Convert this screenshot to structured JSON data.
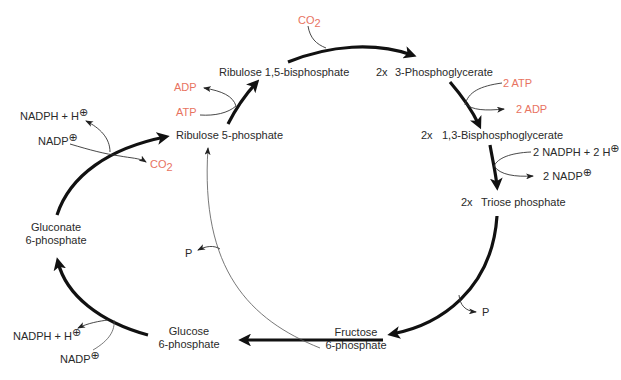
{
  "colors": {
    "text": "#2a2a2a",
    "cofactor_red": "#e8735f",
    "arrow": "#111111"
  },
  "metabolites": {
    "ribulose_15_bisphosphate": "Ribulose 1,5-bisphosphate",
    "phosphoglycerate_3": {
      "stoich": "2x",
      "name": "3-Phosphoglycerate"
    },
    "bisphosphoglycerate_13": {
      "stoich": "2x",
      "name": "1,3-Bisphosphoglycerate"
    },
    "triose_phosphate": {
      "stoich": "2x",
      "name": "Triose phosphate"
    },
    "fructose_6_phosphate": {
      "line1": "Fructose",
      "line2": "6-phosphate"
    },
    "glucose_6_phosphate": {
      "line1": "Glucose",
      "line2": "6-phosphate"
    },
    "gluconate_6_phosphate": {
      "line1": "Gluconate",
      "line2": "6-phosphate"
    },
    "ribulose_5_phosphate": "Ribulose 5-phosphate"
  },
  "cofactors": {
    "carboxylation_co2": {
      "base": "CO",
      "sub": "2"
    },
    "kinase_atp": "2 ATP",
    "kinase_adp": "2 ADP",
    "reduction_nadph": {
      "base": "2 NADPH + 2 H",
      "sup": "⊕"
    },
    "reduction_nadp": {
      "base": "2 NADP",
      "sup": "⊕"
    },
    "phosphatase_p_right": "P",
    "phosphatase_p_left": "P",
    "g6pdh_nadp": {
      "base": "NADP",
      "sup": "⊕"
    },
    "g6pdh_nadph": {
      "base": "NADPH + H",
      "sup": "⊕"
    },
    "6pgdh_nadp": {
      "base": "NADP",
      "sup": "⊕"
    },
    "6pgdh_nadph": {
      "base": "NADPH + H",
      "sup": "⊕"
    },
    "6pgdh_co2": {
      "base": "CO",
      "sub": "2"
    },
    "prk_atp": "ATP",
    "prk_adp": "ADP"
  }
}
